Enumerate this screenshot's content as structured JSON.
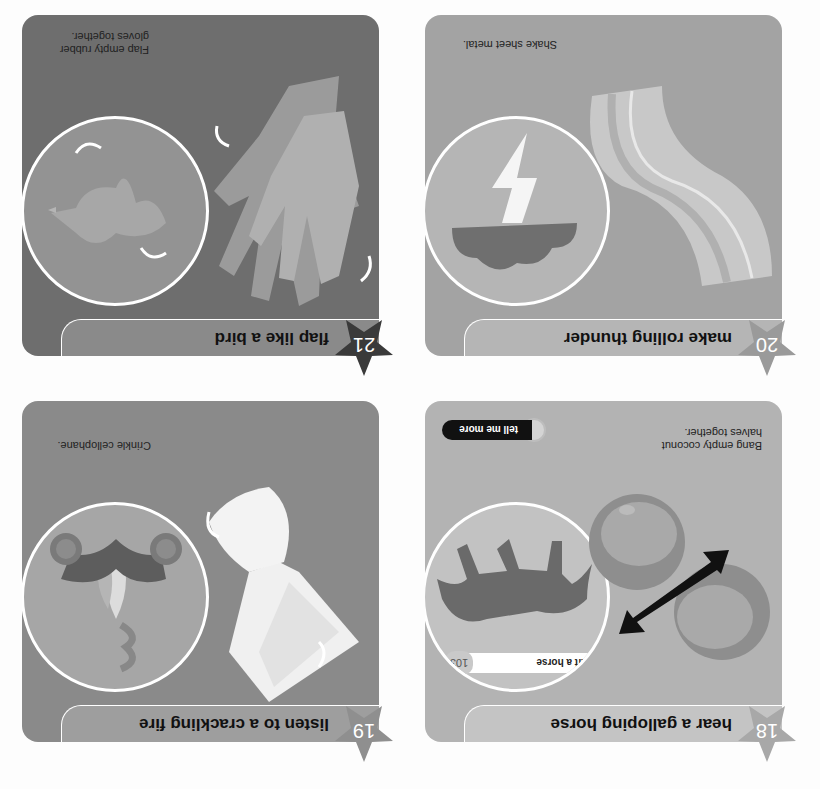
{
  "page": {
    "orientation": "rotated 180 degrees",
    "background": "#fdfdfd"
  },
  "panels": [
    {
      "number": "18",
      "title": "hear a galloping horse",
      "caption": "Bang empty coconut halves together.",
      "bubble_subject": "horse silhouette",
      "illustration": "two coconut halves with double-headed arrow",
      "cross_reference": {
        "number": "103",
        "label": "draft a horse"
      },
      "button": {
        "label": "tell me more"
      },
      "colors": {
        "panel": "#b3b3b3",
        "title_bar": "#c4c4c4",
        "star": "#a8a8a8",
        "bubble": "#c2c2c2"
      }
    },
    {
      "number": "19",
      "title": "listen to a crackling fire",
      "caption": "Crinkle cellophane.",
      "bubble_subject": "campfire with logs and smoke",
      "illustration": "crinkled cellophane",
      "colors": {
        "panel": "#8a8a8a",
        "title_bar": "#9e9e9e",
        "star": "#8f8f8f",
        "bubble": "#a6a6a6"
      }
    },
    {
      "number": "20",
      "title": "make rolling thunder",
      "caption": "Shake sheet metal.",
      "bubble_subject": "storm cloud with lightning bolt",
      "illustration": "wavy sheet metal",
      "colors": {
        "panel": "#a3a3a3",
        "title_bar": "#b5b5b5",
        "star": "#9a9a9a",
        "bubble": "#b5b5b5"
      }
    },
    {
      "number": "21",
      "title": "flap like a bird",
      "caption": "Flap empty rubber gloves together.",
      "bubble_subject": "flying bird",
      "illustration": "pair of rubber gloves",
      "colors": {
        "panel": "#6e6e6e",
        "title_bar": "#8a8a8a",
        "star": "#3a3a3a",
        "bubble": "#939393"
      }
    }
  ]
}
